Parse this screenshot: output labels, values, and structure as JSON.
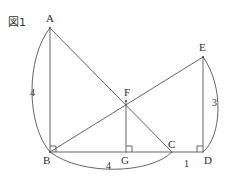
{
  "figure": {
    "caption": "図1",
    "caption_pos": {
      "x": 8,
      "y": 13
    },
    "stroke_color": "#55545a",
    "background": "#ffffff",
    "stroke_width": 0.9
  },
  "points": [
    {
      "id": "A",
      "label": "A",
      "x": 50,
      "y": 28,
      "label_x": 46,
      "label_y": 13
    },
    {
      "id": "B",
      "label": "B",
      "x": 50,
      "y": 152,
      "label_x": 43,
      "label_y": 155
    },
    {
      "id": "C",
      "label": "C",
      "x": 172,
      "y": 152,
      "label_x": 168,
      "label_y": 139
    },
    {
      "id": "D",
      "label": "D",
      "x": 203,
      "y": 152,
      "label_x": 204,
      "label_y": 155
    },
    {
      "id": "E",
      "label": "E",
      "x": 203,
      "y": 57,
      "label_x": 199,
      "label_y": 42
    },
    {
      "id": "F",
      "label": "F",
      "x": 126,
      "y": 101,
      "label_x": 124,
      "label_y": 87
    },
    {
      "id": "G",
      "label": "G",
      "x": 126,
      "y": 152,
      "label_x": 121,
      "label_y": 155
    }
  ],
  "segments": [
    {
      "name": "segment-AB",
      "from": "A",
      "to": "B"
    },
    {
      "name": "segment-AC",
      "from": "A",
      "to": "C"
    },
    {
      "name": "segment-BE",
      "from": "B",
      "to": "E"
    },
    {
      "name": "segment-ED",
      "from": "E",
      "to": "D"
    },
    {
      "name": "segment-FG",
      "from": "F",
      "to": "G"
    },
    {
      "name": "segment-BD",
      "from": "B",
      "to": "D"
    }
  ],
  "arcs": [
    {
      "name": "arc-A-B",
      "d": "M 50 28 C 26 58, 26 124, 50 152"
    },
    {
      "name": "arc-B-C",
      "d": "M 50 152 C 82 176, 150 174, 172 152"
    },
    {
      "name": "arc-E-D",
      "d": "M 203 57 C 224 86, 222 136, 203 152"
    }
  ],
  "right_angles": [
    {
      "name": "right-angle-B",
      "x": 50,
      "y": 152,
      "dir": "up-right"
    },
    {
      "name": "right-angle-G",
      "x": 126,
      "y": 152,
      "dir": "up-right"
    },
    {
      "name": "right-angle-D",
      "x": 203,
      "y": 152,
      "dir": "up-left"
    }
  ],
  "lengths": [
    {
      "name": "length-AB",
      "value": "4",
      "x": 30,
      "y": 88
    },
    {
      "name": "length-BC",
      "value": "4",
      "x": 106,
      "y": 161
    },
    {
      "name": "length-CD",
      "value": "1",
      "x": 184,
      "y": 159
    },
    {
      "name": "length-ED",
      "value": "3",
      "x": 212,
      "y": 98
    }
  ]
}
